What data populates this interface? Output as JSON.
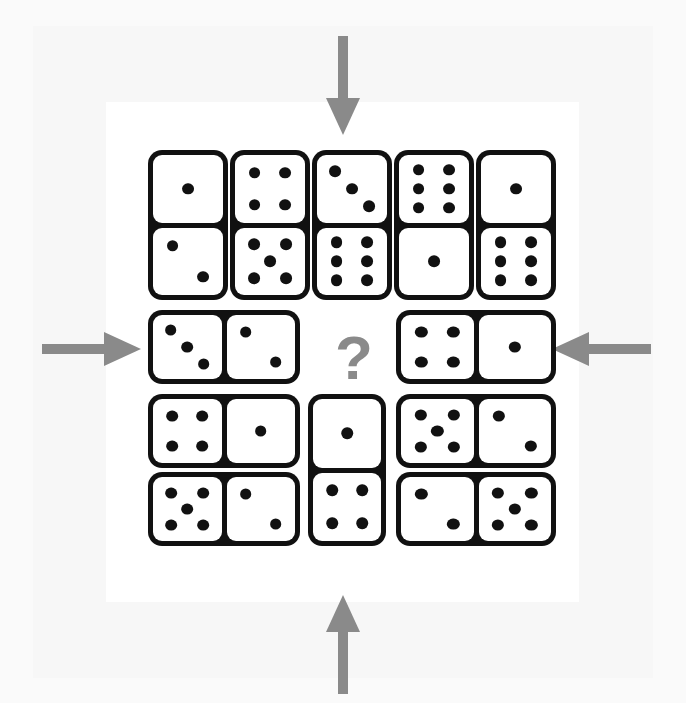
{
  "puzzle": {
    "title": "Domino grid logic puzzle",
    "question_mark": "?",
    "background_color": "#fafafa",
    "panel_color": "#f7f7f7",
    "card_color": "#ffffff",
    "domino_color": "#111111",
    "pip_color": "#111111",
    "arrow_color": "#8a8a8a",
    "question_color": "#8a8a8a"
  },
  "arrows": [
    {
      "name": "arrow-top",
      "direction": "down",
      "label": "down arrow"
    },
    {
      "name": "arrow-bottom",
      "direction": "up",
      "label": "up arrow"
    },
    {
      "name": "arrow-left",
      "direction": "right",
      "label": "right arrow"
    },
    {
      "name": "arrow-right",
      "direction": "left",
      "label": "left arrow"
    }
  ],
  "dominoes": [
    {
      "id": "d1",
      "orientation": "vertical",
      "position": "top-col-1",
      "values": [
        1,
        2
      ],
      "top": 1,
      "bottom": 2
    },
    {
      "id": "d2",
      "orientation": "vertical",
      "position": "top-col-2",
      "values": [
        4,
        5
      ],
      "top": 4,
      "bottom": 5
    },
    {
      "id": "d3",
      "orientation": "vertical",
      "position": "top-col-3",
      "values": [
        3,
        6
      ],
      "top": 3,
      "bottom": 6
    },
    {
      "id": "d4",
      "orientation": "vertical",
      "position": "top-col-4",
      "values": [
        6,
        1
      ],
      "top": 6,
      "bottom": 1
    },
    {
      "id": "d5",
      "orientation": "vertical",
      "position": "top-col-5",
      "values": [
        1,
        6
      ],
      "top": 1,
      "bottom": 6
    },
    {
      "id": "d6",
      "orientation": "horizontal",
      "position": "mid-left",
      "values": [
        3,
        2
      ],
      "left": 3,
      "right": 2
    },
    {
      "id": "d7",
      "orientation": "horizontal",
      "position": "mid-right",
      "values": [
        4,
        1
      ],
      "left": 4,
      "right": 1
    },
    {
      "id": "d8",
      "orientation": "horizontal",
      "position": "lower-left-r1",
      "values": [
        4,
        1
      ],
      "left": 4,
      "right": 1
    },
    {
      "id": "d9",
      "orientation": "horizontal",
      "position": "lower-left-r2",
      "values": [
        5,
        2
      ],
      "left": 5,
      "right": 2
    },
    {
      "id": "d10",
      "orientation": "vertical",
      "position": "lower-center",
      "values": [
        1,
        4
      ],
      "top": 1,
      "bottom": 4
    },
    {
      "id": "d11",
      "orientation": "horizontal",
      "position": "lower-right-r1",
      "values": [
        5,
        2
      ],
      "left": 5,
      "right": 2
    },
    {
      "id": "d12",
      "orientation": "horizontal",
      "position": "lower-right-r2",
      "values": [
        2,
        5
      ],
      "left": 2,
      "right": 5
    }
  ],
  "missing_slot": {
    "name": "missing-domino",
    "marker": "?",
    "position": "center"
  }
}
